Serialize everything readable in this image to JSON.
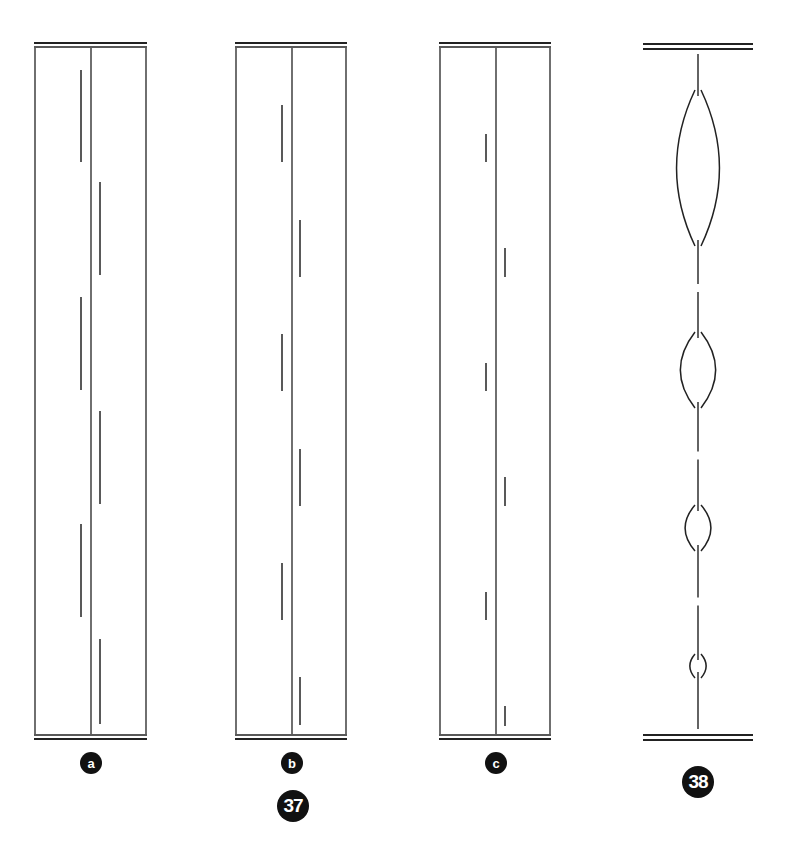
{
  "figure": {
    "figure_numbers": [
      "37",
      "38"
    ],
    "panels": [
      {
        "label": "a",
        "box": {
          "x": 35,
          "y": 48,
          "w": 111,
          "h": 686
        },
        "center_x": 91,
        "left_x": 81,
        "right_x": 100,
        "left_segments": [
          [
            70,
            162
          ],
          [
            297,
            390
          ],
          [
            524,
            617
          ]
        ],
        "right_segments": [
          [
            182,
            275
          ],
          [
            411,
            504
          ],
          [
            639,
            724
          ]
        ]
      },
      {
        "label": "b",
        "box": {
          "x": 236,
          "y": 48,
          "w": 110,
          "h": 686
        },
        "center_x": 292,
        "left_x": 282,
        "right_x": 300,
        "left_segments": [
          [
            105,
            162
          ],
          [
            334,
            391
          ],
          [
            563,
            620
          ]
        ],
        "right_segments": [
          [
            220,
            277
          ],
          [
            449,
            506
          ],
          [
            677,
            725
          ]
        ]
      },
      {
        "label": "c",
        "box": {
          "x": 440,
          "y": 48,
          "w": 110,
          "h": 686
        },
        "center_x": 496,
        "left_x": 486,
        "right_x": 505,
        "left_segments": [
          [
            134,
            162
          ],
          [
            363,
            391
          ],
          [
            592,
            620
          ]
        ],
        "right_segments": [
          [
            248,
            277
          ],
          [
            477,
            506
          ],
          [
            706,
            726
          ]
        ]
      }
    ],
    "panel_38": {
      "top_bar_y": 46,
      "bottom_bar_y": 737,
      "bar_x1": 643,
      "bar_x2": 753,
      "axis_x": 698,
      "bulges": [
        {
          "cy": 168,
          "ry": 80,
          "rx": 21
        },
        {
          "cy": 370,
          "ry": 40,
          "rx": 17
        },
        {
          "cy": 528,
          "ry": 25,
          "rx": 12
        },
        {
          "cy": 666,
          "ry": 14,
          "rx": 7
        }
      ]
    },
    "labels": {
      "a": "a",
      "b": "b",
      "c": "c",
      "fig37": "37",
      "fig38": "38"
    }
  }
}
